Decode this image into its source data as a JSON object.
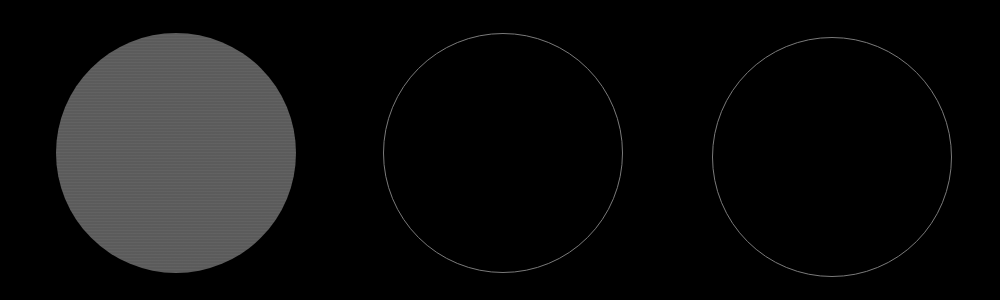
{
  "scene": {
    "background": "#000000",
    "circles": [
      {
        "name": "filled-disc",
        "style": "filled",
        "cx": 176,
        "cy": 153,
        "r": 120,
        "fill": "#5e5e5e"
      },
      {
        "name": "outline-ring-middle",
        "style": "outline",
        "cx": 503,
        "cy": 153,
        "r": 120,
        "stroke": "#7a7a7a"
      },
      {
        "name": "outline-ring-right",
        "style": "outline",
        "cx": 832,
        "cy": 157,
        "r": 120,
        "stroke": "#7a7a7a"
      }
    ]
  }
}
